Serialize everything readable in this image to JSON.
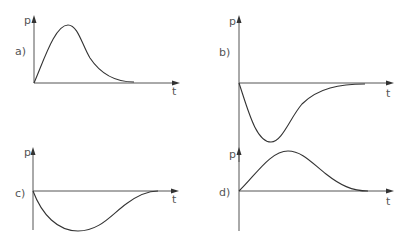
{
  "figure": {
    "colors": {
      "axis": "#555555",
      "curve": "#333333",
      "label": "#555555",
      "background": "#ffffff"
    },
    "panels": [
      {
        "id": "a",
        "label": "a)",
        "y_axis_label": "p",
        "x_axis_label": "t",
        "shape": "positive pulse, fast rise, early peak, slow decay to zero"
      },
      {
        "id": "b",
        "label": "b)",
        "y_axis_label": "p",
        "x_axis_label": "t",
        "shape": "negative pulse, fast drop, early minimum, slow return to zero"
      },
      {
        "id": "c",
        "label": "c)",
        "y_axis_label": "p",
        "x_axis_label": "t",
        "shape": "negative pulse, gradual drop, broad minimum, gradual return to zero"
      },
      {
        "id": "d",
        "label": "d)",
        "y_axis_label": "p",
        "x_axis_label": "t",
        "shape": "positive pulse, gradual rise, broad peak, gradual decay to zero"
      }
    ]
  }
}
